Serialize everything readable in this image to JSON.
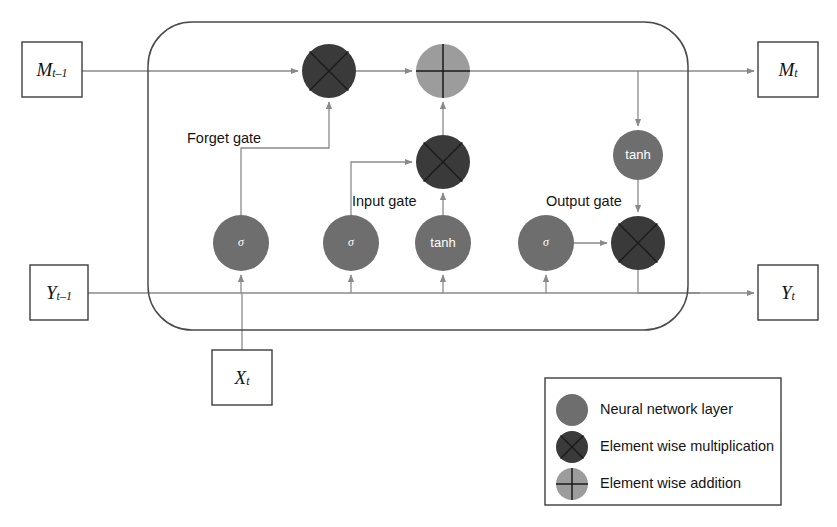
{
  "figure": {
    "background": "#ffffff"
  },
  "colors": {
    "line": "#8a8a8a",
    "outline": "#4a4a4a",
    "box_stroke": "#3d3d3d",
    "neural_layer": "#6e6e6e",
    "multiplication": "#3a3a3a",
    "addition": "#9c9c9c",
    "cross_stroke": "#1a1a1a",
    "text": "#141414",
    "node_text": "#ffffff"
  },
  "io_boxes": [
    {
      "id": "m-prev",
      "name": "memory-in-box",
      "base": "M",
      "sub": "t–1",
      "x": 22,
      "y": 42,
      "w": 60,
      "h": 55
    },
    {
      "id": "m-next",
      "name": "memory-out-box",
      "base": "M",
      "sub": "t",
      "x": 758,
      "y": 42,
      "w": 60,
      "h": 55
    },
    {
      "id": "y-prev",
      "name": "output-in-box",
      "base": "Y",
      "sub": "t–1",
      "x": 30,
      "y": 265,
      "w": 58,
      "h": 55
    },
    {
      "id": "y-next",
      "name": "output-out-box",
      "base": "Y",
      "sub": "t",
      "x": 758,
      "y": 265,
      "w": 60,
      "h": 55
    },
    {
      "id": "x-in",
      "name": "input-box",
      "base": "X",
      "sub": "t",
      "x": 212,
      "y": 350,
      "w": 60,
      "h": 55
    }
  ],
  "cell_body": {
    "label": "lstm-cell-boundary",
    "x": 148,
    "y": 22,
    "w": 540,
    "h": 308,
    "radius": 44
  },
  "gate_labels": [
    {
      "id": "forget",
      "text": "Forget gate",
      "x": 187,
      "y": 130
    },
    {
      "id": "input",
      "text": "Input gate",
      "x": 352,
      "y": 193
    },
    {
      "id": "output",
      "text": "Output gate",
      "x": 546,
      "y": 193
    }
  ],
  "nodes": [
    {
      "id": "mul-forget",
      "name": "forget-multiply-node",
      "kind": "multiplication",
      "cx": 329,
      "cy": 71,
      "r": 27,
      "label": ""
    },
    {
      "id": "add-state",
      "name": "state-add-node",
      "kind": "addition",
      "cx": 443,
      "cy": 71,
      "r": 27,
      "label": ""
    },
    {
      "id": "mul-input",
      "name": "input-multiply-node",
      "kind": "multiplication",
      "cx": 443,
      "cy": 162,
      "r": 27,
      "label": ""
    },
    {
      "id": "tanh-out",
      "name": "output-tanh-node",
      "kind": "neural",
      "cx": 638,
      "cy": 155,
      "r": 25,
      "label": "tanh"
    },
    {
      "id": "sigma-f",
      "name": "forget-sigmoid-node",
      "kind": "neural",
      "cx": 241,
      "cy": 243,
      "r": 28,
      "label": "σ"
    },
    {
      "id": "sigma-i",
      "name": "input-sigmoid-node",
      "kind": "neural",
      "cx": 351,
      "cy": 243,
      "r": 28,
      "label": "σ"
    },
    {
      "id": "tanh-c",
      "name": "candidate-tanh-node",
      "kind": "neural",
      "cx": 443,
      "cy": 243,
      "r": 28,
      "label": "tanh"
    },
    {
      "id": "sigma-o",
      "name": "output-sigmoid-node",
      "kind": "neural",
      "cx": 546,
      "cy": 243,
      "r": 28,
      "label": "σ"
    },
    {
      "id": "mul-out",
      "name": "output-multiply-node",
      "kind": "multiplication",
      "cx": 638,
      "cy": 243,
      "r": 27,
      "label": ""
    }
  ],
  "legend": {
    "name": "legend-panel",
    "box": {
      "x": 545,
      "y": 378,
      "w": 236,
      "h": 127
    },
    "items": [
      {
        "id": "neural",
        "kind": "neural",
        "label": "Neural network layer",
        "cy": 410
      },
      {
        "id": "mul",
        "kind": "multiplication",
        "label": "Element wise multiplication",
        "cy": 447
      },
      {
        "id": "add",
        "kind": "addition",
        "label": "Element wise addition",
        "cy": 484
      }
    ],
    "swatch_x": 572,
    "swatch_r": 16,
    "text_x": 600
  },
  "wires": {
    "memory_line_y": 71,
    "output_line_y": 293,
    "description": "memory lane across top, hidden-state lane across bottom"
  }
}
